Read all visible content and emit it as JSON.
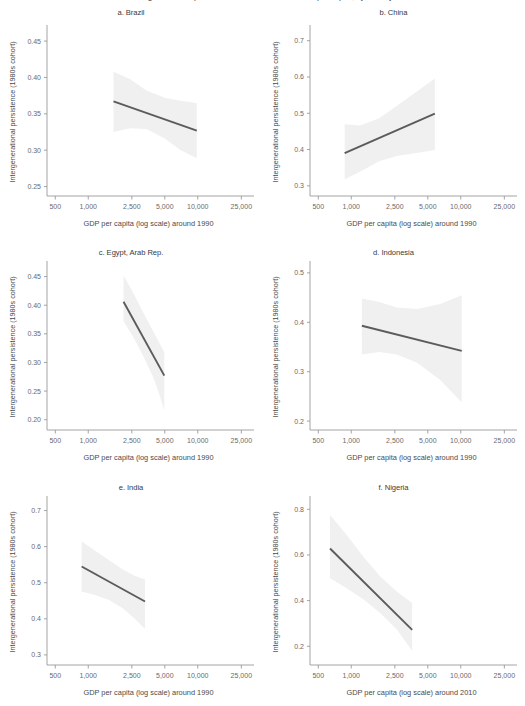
{
  "figure": {
    "title_cutoff": "Intergenerational persistence in education and GDP per capita, by country",
    "line_color": "#5b5b5d",
    "band_color": "#f0f0f0",
    "axis_color": "#9a9a9c",
    "text_color": "#58585a"
  },
  "common": {
    "ylabel": "Intergenerational persistence (1980s cohort)",
    "xlabel_1990": "GDP per capita (log scale) around 1990",
    "xlabel_2010": "GDP per capita (log scale) around 2010",
    "xticks": [
      "500",
      "1,000",
      "2,500",
      "5,000",
      "10,000",
      "25,000"
    ],
    "xtick_values": [
      500,
      1000,
      2500,
      5000,
      10000,
      25000
    ],
    "xlim": [
      420,
      30000
    ]
  },
  "chart_data": [
    {
      "id": "brazil",
      "type": "line",
      "title": "a. Brazil",
      "xlabel": "GDP per capita (log scale) around 1990",
      "ylabel": "Intergenerational persistence (1980s cohort)",
      "xscale": "log",
      "xlim": [
        420,
        30000
      ],
      "ylim": [
        0.237,
        0.468
      ],
      "yticks": [
        "0.25",
        "0.30",
        "0.35",
        "0.40",
        "0.45"
      ],
      "ytick_values": [
        0.25,
        0.3,
        0.35,
        0.4,
        0.45
      ],
      "grid": false,
      "legend": "none",
      "fit_line": {
        "x": [
          1700,
          9800
        ],
        "y": [
          0.367,
          0.327
        ]
      },
      "band": {
        "x": [
          1700,
          2400,
          3400,
          5000,
          7000,
          9800
        ],
        "upper": [
          0.408,
          0.398,
          0.382,
          0.372,
          0.368,
          0.365
        ],
        "lower": [
          0.325,
          0.33,
          0.329,
          0.316,
          0.3,
          0.289
        ]
      }
    },
    {
      "id": "china",
      "type": "line",
      "title": "b. China",
      "xlabel": "GDP per capita (log scale) around 1990",
      "ylabel": "Intergenerational persistence (1980s cohort)",
      "xscale": "log",
      "xlim": [
        420,
        30000
      ],
      "ylim": [
        0.272,
        0.735
      ],
      "yticks": [
        "0.3",
        "0.4",
        "0.5",
        "0.6",
        "0.7"
      ],
      "ytick_values": [
        0.3,
        0.4,
        0.5,
        0.6,
        0.7
      ],
      "grid": false,
      "legend": "none",
      "fit_line": {
        "x": [
          870,
          5800
        ],
        "y": [
          0.39,
          0.499
        ]
      },
      "band": {
        "x": [
          870,
          1200,
          1800,
          2600,
          3800,
          5800
        ],
        "upper": [
          0.47,
          0.466,
          0.486,
          0.52,
          0.556,
          0.596
        ],
        "lower": [
          0.318,
          0.339,
          0.368,
          0.382,
          0.39,
          0.399
        ]
      }
    },
    {
      "id": "egypt",
      "type": "line",
      "title": "c. Egypt, Arab Rep.",
      "xlabel": "GDP per capita (log scale) around 1990",
      "ylabel": "Intergenerational persistence (1980s cohort)",
      "xscale": "log",
      "xlim": [
        420,
        30000
      ],
      "ylim": [
        0.182,
        0.472
      ],
      "yticks": [
        "0.20",
        "0.25",
        "0.30",
        "0.35",
        "0.40",
        "0.45"
      ],
      "ytick_values": [
        0.2,
        0.25,
        0.3,
        0.35,
        0.4,
        0.45
      ],
      "grid": false,
      "legend": "none",
      "fit_line": {
        "x": [
          2100,
          4950
        ],
        "y": [
          0.406,
          0.277
        ]
      },
      "band": {
        "x": [
          2100,
          2600,
          3200,
          3900,
          4400,
          4950
        ],
        "upper": [
          0.452,
          0.42,
          0.386,
          0.355,
          0.336,
          0.318
        ],
        "lower": [
          0.372,
          0.343,
          0.31,
          0.275,
          0.248,
          0.216
        ]
      }
    },
    {
      "id": "indonesia",
      "type": "line",
      "title": "d. Indonesia",
      "xlabel": "GDP per capita (log scale) around 1990",
      "ylabel": "Intergenerational persistence (1980s cohort)",
      "xscale": "log",
      "xlim": [
        420,
        30000
      ],
      "ylim": [
        0.182,
        0.518
      ],
      "yticks": [
        "0.2",
        "0.3",
        "0.4",
        "0.5"
      ],
      "ytick_values": [
        0.2,
        0.3,
        0.4,
        0.5
      ],
      "grid": false,
      "legend": "none",
      "fit_line": {
        "x": [
          1250,
          10200
        ],
        "y": [
          0.393,
          0.342
        ]
      },
      "band": {
        "x": [
          1250,
          1800,
          2600,
          4000,
          6500,
          10200
        ],
        "upper": [
          0.448,
          0.441,
          0.43,
          0.427,
          0.437,
          0.455
        ],
        "lower": [
          0.335,
          0.34,
          0.335,
          0.318,
          0.283,
          0.238
        ]
      }
    },
    {
      "id": "india",
      "type": "line",
      "title": "e. India",
      "xlabel": "GDP per capita (log scale) around 1990",
      "ylabel": "Intergenerational persistence (1980s cohort)",
      "xscale": "log",
      "xlim": [
        420,
        30000
      ],
      "ylim": [
        0.272,
        0.732
      ],
      "yticks": [
        "0.3",
        "0.4",
        "0.5",
        "0.6",
        "0.7"
      ],
      "ytick_values": [
        0.3,
        0.4,
        0.5,
        0.6,
        0.7
      ],
      "grid": false,
      "legend": "none",
      "fit_line": {
        "x": [
          870,
          3300
        ],
        "y": [
          0.545,
          0.448
        ]
      },
      "band": {
        "x": [
          870,
          1150,
          1550,
          2050,
          2650,
          3300
        ],
        "upper": [
          0.614,
          0.589,
          0.562,
          0.537,
          0.519,
          0.509
        ],
        "lower": [
          0.476,
          0.466,
          0.452,
          0.43,
          0.401,
          0.372
        ]
      }
    },
    {
      "id": "nigeria",
      "type": "line",
      "title": "f. Nigeria",
      "xlabel": "GDP per capita (log scale) around 2010",
      "ylabel": "Intergenerational persistence (1980s cohort)",
      "xscale": "log",
      "xlim": [
        420,
        30000
      ],
      "ylim": [
        0.118,
        0.845
      ],
      "yticks": [
        "0.2",
        "0.4",
        "0.6",
        "0.8"
      ],
      "ytick_values": [
        0.2,
        0.4,
        0.6,
        0.8
      ],
      "grid": false,
      "legend": "none",
      "fit_line": {
        "x": [
          640,
          3600
        ],
        "y": [
          0.628,
          0.272
        ]
      },
      "band": {
        "x": [
          640,
          900,
          1300,
          1850,
          2600,
          3600
        ],
        "upper": [
          0.775,
          0.69,
          0.59,
          0.505,
          0.44,
          0.39
        ],
        "lower": [
          0.498,
          0.455,
          0.405,
          0.345,
          0.275,
          0.18
        ]
      }
    }
  ]
}
